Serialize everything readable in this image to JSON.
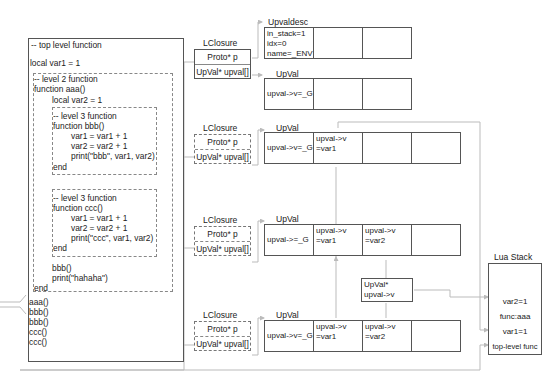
{
  "code": {
    "top_comment": "-- top level function",
    "local_var1": "local var1 = 1",
    "level2": {
      "comment": "-- level 2 function",
      "signature": "function aaa()",
      "local_var2": "local var2 = 1",
      "end": "end",
      "calls": [
        "bbb()",
        "print(\"hahaha\")"
      ]
    },
    "bbb": {
      "comment": "-- level 3 function",
      "signature": "function bbb()",
      "body": [
        "var1 = var1 + 1",
        "var2 = var2 + 1",
        "print(\"bbb\", var1, var2)"
      ],
      "end": "end"
    },
    "ccc": {
      "comment": "-- level 3 function",
      "signature": "function ccc()",
      "body": [
        "var1 = var1 + 1",
        "var2 = var2 + 1",
        "print(\"ccc\", var1, var2)"
      ],
      "end": "end"
    },
    "top_calls": [
      "aaa()",
      "bbb()",
      "bbb()",
      "ccc()",
      "ccc()"
    ]
  },
  "closures": [
    {
      "title": "LClosure",
      "proto": "Proto* p",
      "upval": "UpVal* upval[]"
    },
    {
      "title": "LClosure",
      "proto": "Proto* p",
      "upval": "UpVal* upval[]"
    },
    {
      "title": "LClosure",
      "proto": "Proto* p",
      "upval": "UpVal* upval[]"
    },
    {
      "title": "LClosure",
      "proto": "Proto* p",
      "upval": "UpVal* upval[]"
    }
  ],
  "upvaldesc": {
    "title": "Upvaldesc",
    "cells": [
      "in_stack=1\nidx=0\nname=_ENV",
      "",
      ""
    ]
  },
  "upval_arrays": [
    {
      "title": "UpVal",
      "cells": [
        "upval->v=_G",
        "",
        ""
      ]
    },
    {
      "title": "UpVal",
      "cells": [
        "upval->v=_G",
        "upval->v\n=var1",
        "",
        ""
      ]
    },
    {
      "title": "UpVal",
      "cells": [
        "upval->=_G",
        "upval->v\n=var1",
        "upval->v\n=var2",
        ""
      ]
    },
    {
      "title": "UpVal",
      "cells": [
        "upval->v=_G",
        "upval->v\n=var1",
        "upval->v\n=var2",
        ""
      ]
    }
  ],
  "upval_ptr": {
    "lines": "UpVal*\nupval->v"
  },
  "lua_stack": {
    "title": "Lua Stack",
    "cells": [
      "",
      "",
      "var2=1",
      "func:aaa",
      "var1=1",
      "top-level func"
    ]
  }
}
